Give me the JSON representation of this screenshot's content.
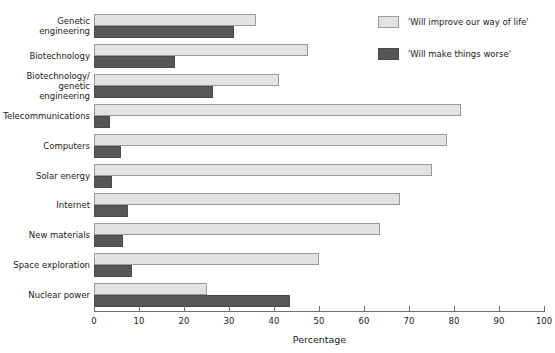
{
  "chart_data": {
    "type": "bar",
    "orientation": "horizontal",
    "title": "",
    "xlabel": "Percentage",
    "ylabel": "",
    "xlim": [
      0,
      100
    ],
    "xticks": [
      0,
      10,
      20,
      30,
      40,
      50,
      60,
      70,
      80,
      90,
      100
    ],
    "grid": false,
    "legend_position": "top-right",
    "categories": [
      "Genetic engineering",
      "Biotechnology",
      "Biotechnology/ genetic engineering",
      "Telecommunications",
      "Computers",
      "Solar energy",
      "Internet",
      "New materials",
      "Space exploration",
      "Nuclear power"
    ],
    "series": [
      {
        "name": "'Will improve our way of life'",
        "color": "#e2e2e2",
        "values": [
          36,
          47.5,
          41,
          81.5,
          78.5,
          75,
          68,
          63.5,
          50,
          25
        ]
      },
      {
        "name": "'Will make things worse'",
        "color": "#575757",
        "values": [
          31,
          18,
          26.5,
          3.5,
          6,
          4,
          7.5,
          6.5,
          8.5,
          43.5
        ]
      }
    ]
  },
  "category_labels": [
    [
      "Genetic",
      "engineering"
    ],
    [
      "Biotechnology"
    ],
    [
      "Biotechnology/",
      "genetic",
      "engineering"
    ],
    [
      "Telecommunications"
    ],
    [
      "Computers"
    ],
    [
      "Solar energy"
    ],
    [
      "Internet"
    ],
    [
      "New materials"
    ],
    [
      "Space exploration"
    ],
    [
      "Nuclear power"
    ]
  ],
  "axis": {
    "title": "Percentage",
    "ticks": [
      "0",
      "10",
      "20",
      "30",
      "40",
      "50",
      "60",
      "70",
      "80",
      "90",
      "100"
    ]
  },
  "legend": {
    "items": [
      {
        "label": "'Will improve our way of life'",
        "key": "improve"
      },
      {
        "label": "'Will make things worse'",
        "key": "worse"
      }
    ]
  }
}
